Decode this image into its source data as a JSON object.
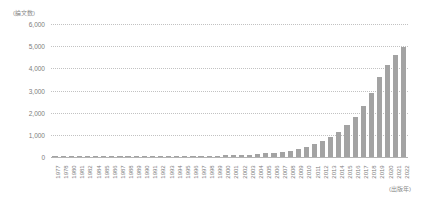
{
  "chart_data": {
    "type": "bar",
    "title": "",
    "subtitle": "",
    "xlabel": "(出版年)",
    "ylabel": "(論文数)",
    "ylim": [
      0,
      6000
    ],
    "ytick_labels": [
      "6,000",
      "5,000",
      "4,000",
      "3,000",
      "2,000",
      "1,000",
      "0"
    ],
    "ytick_values": [
      6000,
      5000,
      4000,
      3000,
      2000,
      1000,
      0
    ],
    "grid": "horizontal-dotted",
    "legend": "none",
    "bar_color": "#a3a3a3",
    "gridline_color": "#c2c2c2",
    "axis_color": "#b4b4b4",
    "text_color": "#7d7d7d",
    "categories": [
      "1977",
      "1978",
      "1980",
      "1981",
      "1982",
      "1984",
      "1985",
      "1986",
      "1987",
      "1988",
      "1989",
      "1990",
      "1991",
      "1992",
      "1993",
      "1994",
      "1995",
      "1996",
      "1997",
      "1998",
      "1999",
      "2000",
      "2001",
      "2002",
      "2003",
      "2004",
      "2005",
      "2006",
      "2007",
      "2008",
      "2009",
      "2010",
      "2011",
      "2012",
      "2013",
      "2014",
      "2015",
      "2016",
      "2017",
      "2018",
      "2019",
      "2020",
      "2021",
      "2022"
    ],
    "values": [
      5,
      5,
      5,
      5,
      5,
      5,
      5,
      10,
      10,
      10,
      15,
      15,
      20,
      20,
      25,
      30,
      35,
      40,
      45,
      50,
      60,
      70,
      80,
      95,
      110,
      130,
      160,
      190,
      230,
      290,
      360,
      450,
      580,
      720,
      900,
      1150,
      1450,
      1800,
      2300,
      2900,
      3600,
      4150,
      4600,
      4980
    ]
  }
}
